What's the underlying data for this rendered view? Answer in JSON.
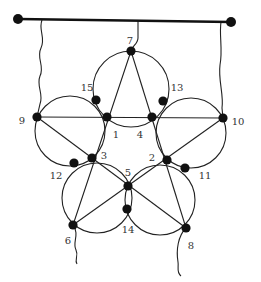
{
  "diagram": {
    "type": "pentagram-with-circles",
    "colors": {
      "line": "#222222",
      "node": "#111111",
      "label": "#333333",
      "background": "#ffffff"
    },
    "top_bar": {
      "x1": 18,
      "y1": 19,
      "x2": 231,
      "y2": 22
    },
    "strings": [
      {
        "id": "left-string",
        "path": "M42 20 C38 30 46 38 41 48 C36 58 45 66 40 76 C36 86 44 94 40 104 L37 117"
      },
      {
        "id": "right-string",
        "path": "M221 22 C219 35 223 50 220 65 C218 80 224 95 222 108 L223 118"
      },
      {
        "id": "top-string",
        "path": "M138 21 L138 38 C138 44 132 46 131 51"
      },
      {
        "id": "node6-tail",
        "path": "M73 225 C80 235 72 242 76 250 C79 256 74 260 77 264"
      },
      {
        "id": "node8-tail",
        "path": "M186 228 C178 236 176 250 178 262 C179 268 176 272 181 276"
      }
    ],
    "star_lines": [
      {
        "from": "7",
        "to": "6",
        "x1": 131,
        "y1": 51,
        "x2": 73,
        "y2": 225
      },
      {
        "from": "7",
        "to": "8",
        "x1": 131,
        "y1": 51,
        "x2": 186,
        "y2": 228
      },
      {
        "from": "9",
        "to": "10",
        "x1": 37,
        "y1": 117,
        "x2": 223,
        "y2": 118
      },
      {
        "from": "9",
        "to": "8",
        "x1": 37,
        "y1": 117,
        "x2": 186,
        "y2": 228
      },
      {
        "from": "10",
        "to": "6",
        "x1": 223,
        "y1": 118,
        "x2": 73,
        "y2": 225
      }
    ],
    "circles": [
      {
        "id": "top",
        "cx": 131,
        "cy": 89,
        "r": 38
      },
      {
        "id": "left",
        "cx": 70,
        "cy": 131,
        "r": 35
      },
      {
        "id": "right",
        "cx": 191,
        "cy": 133,
        "r": 35
      },
      {
        "id": "bottom-left",
        "cx": 97,
        "cy": 198,
        "r": 35
      },
      {
        "id": "bottom-right",
        "cx": 160,
        "cy": 200,
        "r": 35
      }
    ],
    "nodes": [
      {
        "id": "1",
        "x": 107,
        "y": 117,
        "label": "1",
        "lx": 116,
        "ly": 135
      },
      {
        "id": "2",
        "x": 167,
        "y": 160,
        "label": "2",
        "lx": 152,
        "ly": 158
      },
      {
        "id": "3",
        "x": 92,
        "y": 158,
        "label": "3",
        "lx": 104,
        "ly": 156
      },
      {
        "id": "4",
        "x": 152,
        "y": 117,
        "label": "4",
        "lx": 140,
        "ly": 135
      },
      {
        "id": "5",
        "x": 128,
        "y": 186,
        "label": "5",
        "lx": 128,
        "ly": 173
      },
      {
        "id": "6",
        "x": 73,
        "y": 225,
        "label": "6",
        "lx": 68,
        "ly": 241
      },
      {
        "id": "7",
        "x": 131,
        "y": 51,
        "label": "7",
        "lx": 130,
        "ly": 41
      },
      {
        "id": "8",
        "x": 186,
        "y": 228,
        "label": "8",
        "lx": 191,
        "ly": 246
      },
      {
        "id": "9",
        "x": 37,
        "y": 117,
        "label": "9",
        "lx": 22,
        "ly": 121
      },
      {
        "id": "10",
        "x": 223,
        "y": 118,
        "label": "10",
        "lx": 238,
        "ly": 122
      },
      {
        "id": "11",
        "x": 185,
        "y": 168,
        "label": "11",
        "lx": 205,
        "ly": 176
      },
      {
        "id": "12",
        "x": 74,
        "y": 163,
        "label": "12",
        "lx": 56,
        "ly": 176
      },
      {
        "id": "13",
        "x": 163,
        "y": 101,
        "label": "13",
        "lx": 177,
        "ly": 88
      },
      {
        "id": "14",
        "x": 127,
        "y": 209,
        "label": "14",
        "lx": 128,
        "ly": 230
      },
      {
        "id": "15",
        "x": 96,
        "y": 100,
        "label": "15",
        "lx": 87,
        "ly": 88
      }
    ],
    "end_points": [
      {
        "id": "bar-left",
        "x": 18,
        "y": 19
      },
      {
        "id": "bar-right",
        "x": 231,
        "y": 22
      }
    ]
  }
}
